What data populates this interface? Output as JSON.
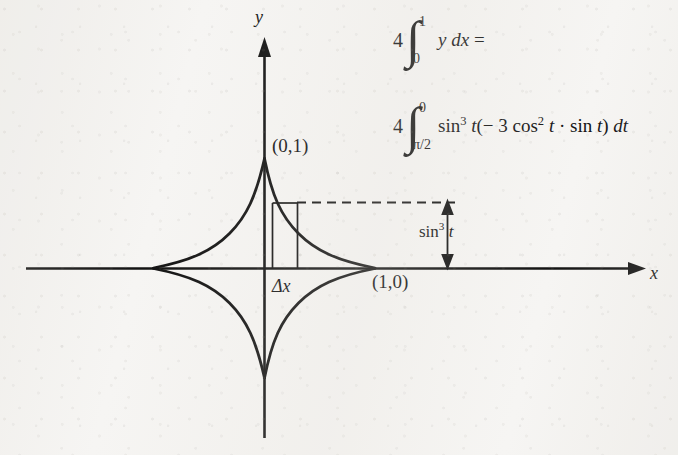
{
  "figure": {
    "axes": {
      "y_label": "y",
      "x_label": "x",
      "origin_px": [
        264,
        268
      ]
    },
    "curve": {
      "name": "astroid",
      "equation": "x = cos^3 t, y = sin^3 t",
      "cusps": [
        {
          "label": "(0,1)",
          "position": "top"
        },
        {
          "label": "(1,0)",
          "position": "right"
        },
        {
          "label": "(0,-1)",
          "position": "bottom"
        },
        {
          "label": "(-1,0)",
          "position": "left"
        }
      ]
    },
    "labels": {
      "point_top": "(0,1)",
      "point_right": "(1,0)",
      "strip_width": "Δx",
      "strip_height_prefix": "sin",
      "strip_height_exp": "3",
      "strip_height_suffix": "t"
    },
    "colors": {
      "ink": "#131313",
      "paper": "#f6f5f3"
    }
  },
  "expressions": [
    {
      "id": "integral-area",
      "coefficient": "4",
      "integral_sign": "∫",
      "upper_limit": "1",
      "lower_limit": "0",
      "integrand": "y dx",
      "trailing": "=",
      "plain": "4 ∫₀¹ y dx ="
    },
    {
      "id": "integral-substituted",
      "coefficient": "4",
      "integral_sign": "∫",
      "upper_limit": "0",
      "lower_limit": "π/2",
      "integrand_parts": {
        "sin_base": "sin",
        "sin_exp": "3",
        "var": "t",
        "open_paren": "(",
        "minus": "−",
        "three": "3",
        "cos_base": "cos",
        "cos_exp": "2",
        "dot": "·",
        "close_paren": ")",
        "differential": "dt"
      },
      "plain": "4 ∫π/2⁰ sin³ t(−3 cos² t · sin t) dt"
    }
  ]
}
